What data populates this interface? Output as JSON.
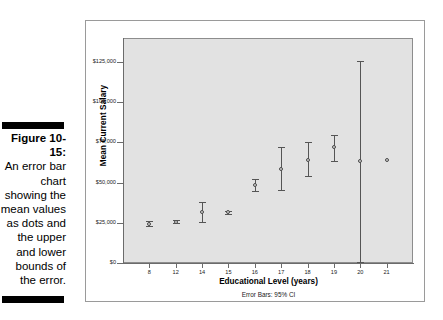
{
  "caption": {
    "label": "Figure 10-15:",
    "body": "An error bar chart showing the mean values as dots and the upper and lower bounds of the error."
  },
  "chart_data": {
    "type": "scatter",
    "title": "",
    "xlabel": "Educational Level (years)",
    "ylabel": "Mean Current Salary",
    "annotation": "Error Bars: 95% CI",
    "grid": false,
    "legend": "none",
    "categories": [
      "8",
      "12",
      "14",
      "15",
      "16",
      "17",
      "18",
      "19",
      "20",
      "21"
    ],
    "x_tick_labels": [
      "8",
      "12",
      "14",
      "15",
      "16",
      "17",
      "18",
      "19",
      "20",
      "21"
    ],
    "y_tick_labels": [
      "$0",
      "$25,000",
      "$50,000",
      "$75,000",
      "$100,000",
      "$125,000"
    ],
    "y_tick_values": [
      0,
      25000,
      50000,
      75000,
      100000,
      125000
    ],
    "ylim": [
      0,
      140000
    ],
    "series": [
      {
        "name": "Mean Current Salary",
        "values": [
          24500,
          25800,
          31800,
          31500,
          48400,
          58800,
          64300,
          72200,
          63700,
          63900
        ],
        "ci_lower": [
          23000,
          25100,
          25800,
          30500,
          44600,
          45500,
          54000,
          63600,
          700,
          null
        ],
        "ci_upper": [
          26000,
          26500,
          38000,
          32500,
          52000,
          72200,
          75200,
          79600,
          126000,
          null
        ]
      }
    ]
  },
  "colors": {
    "plot_background": "#e2e2e2",
    "axis": "#6b6b6b",
    "marker_edge": "#4a4a4a",
    "marker_fill": "#d0d0d0",
    "frame_border": "#9a9a9a",
    "caption_rule": "#000000"
  }
}
